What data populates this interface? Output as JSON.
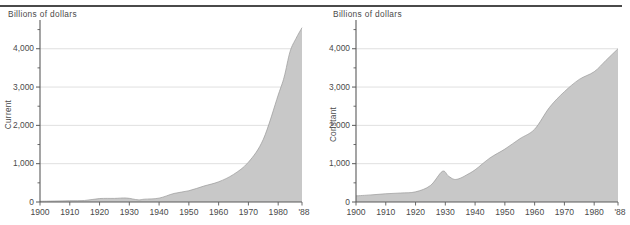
{
  "figure": {
    "panel_count": 2,
    "top_rule_color": "#4a4a4a",
    "area_fill_color": "#c8c8c8",
    "axis_color": "#5a5a5a",
    "grid_color": "#d8d8d8",
    "background_color": "#ffffff"
  },
  "panels": [
    {
      "id": "current",
      "unit_label": "Billions of dollars",
      "axis_title": "Current",
      "x_end_label": "'88"
    },
    {
      "id": "constant",
      "unit_label": "Billions of dollars",
      "axis_title": "Constant",
      "x_end_label": "'88"
    }
  ],
  "chart_data": [
    {
      "type": "area",
      "title": "Current",
      "subtitle": "Billions of dollars",
      "xlabel": "",
      "ylabel": "Current",
      "ylim": [
        0,
        4750
      ],
      "xlim": [
        1900,
        1988
      ],
      "grid": true,
      "legend": "none",
      "ytick_labels": [
        "0",
        "1,000",
        "2,000",
        "3,000",
        "4,000"
      ],
      "ytick_values": [
        0,
        1000,
        2000,
        3000,
        4000
      ],
      "yminor_values": [
        500,
        1500,
        2500,
        3500,
        4500
      ],
      "xtick_labels": [
        "1900",
        "1910",
        "1920",
        "1930",
        "1940",
        "1950",
        "1960",
        "1970",
        "1980",
        "'88"
      ],
      "xtick_values": [
        1900,
        1910,
        1920,
        1930,
        1940,
        1950,
        1960,
        1970,
        1980,
        1988
      ],
      "x": [
        1900,
        1905,
        1910,
        1915,
        1920,
        1925,
        1929,
        1933,
        1935,
        1940,
        1945,
        1950,
        1955,
        1960,
        1965,
        1970,
        1975,
        1980,
        1982,
        1984,
        1986,
        1988
      ],
      "values": [
        19,
        26,
        34,
        40,
        90,
        94,
        104,
        56,
        73,
        101,
        223,
        294,
        415,
        527,
        720,
        1039,
        1636,
        2790,
        3260,
        3930,
        4270,
        4550
      ]
    },
    {
      "type": "area",
      "title": "Constant",
      "subtitle": "Billions of dollars",
      "xlabel": "",
      "ylabel": "Constant",
      "ylim": [
        0,
        4750
      ],
      "xlim": [
        1900,
        1988
      ],
      "grid": true,
      "legend": "none",
      "ytick_labels": [
        "0",
        "1,000",
        "2,000",
        "3,000",
        "4,000"
      ],
      "ytick_values": [
        0,
        1000,
        2000,
        3000,
        4000
      ],
      "yminor_values": [
        500,
        1500,
        2500,
        3500,
        4500
      ],
      "xtick_labels": [
        "1900",
        "1910",
        "1920",
        "1930",
        "1940",
        "1950",
        "1960",
        "1970",
        "1980",
        "'88"
      ],
      "xtick_values": [
        1900,
        1910,
        1920,
        1930,
        1940,
        1950,
        1960,
        1970,
        1980,
        1988
      ],
      "x": [
        1900,
        1905,
        1910,
        1915,
        1920,
        1925,
        1929,
        1931,
        1933,
        1935,
        1937,
        1940,
        1945,
        1950,
        1955,
        1960,
        1965,
        1970,
        1975,
        1980,
        1984,
        1988
      ],
      "values": [
        160,
        185,
        215,
        235,
        265,
        430,
        800,
        680,
        590,
        620,
        700,
        840,
        1150,
        1380,
        1650,
        1900,
        2470,
        2880,
        3200,
        3400,
        3700,
        4000
      ]
    }
  ]
}
